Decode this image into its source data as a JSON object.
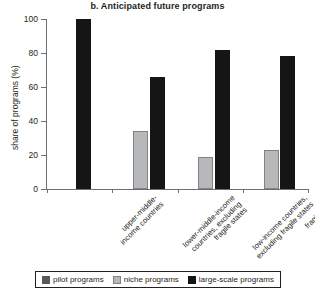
{
  "chart_data": {
    "type": "bar",
    "title": "b. Anticipated future programs",
    "xlabel": "",
    "ylabel": "share of programs (%)",
    "ylim": [
      0,
      100
    ],
    "yticks": [
      0,
      20,
      40,
      60,
      80,
      100
    ],
    "grid": false,
    "legend_position": "bottom",
    "categories": [
      "upper-middle-income countries",
      "lower-middle-income countries, excluding fragile states",
      "low-income countries, excluding fragile states",
      "fragile states"
    ],
    "category_lines": [
      [
        "upper-middle-",
        "income countries"
      ],
      [
        "lower-middle-income",
        "countries, excluding",
        "fragile states"
      ],
      [
        "low-income countries,",
        "excluding fragile states"
      ],
      [
        "fragile states"
      ]
    ],
    "series": [
      {
        "name": "pilot programs",
        "color": "#58595b",
        "values": [
          0,
          0,
          0,
          0
        ]
      },
      {
        "name": "niche programs",
        "color": "#b6b8ba",
        "values": [
          0,
          34,
          19,
          23
        ]
      },
      {
        "name": "large-scale programs",
        "color": "#151515",
        "values": [
          100,
          66,
          82,
          78
        ]
      }
    ]
  }
}
